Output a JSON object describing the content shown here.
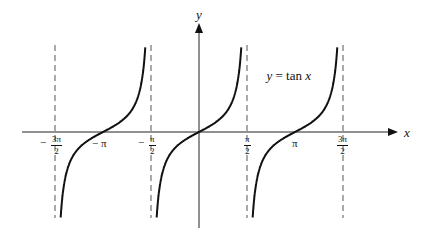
{
  "chart_data": {
    "type": "line",
    "title": "y = tan x",
    "xlabel": "x",
    "ylabel": "y",
    "function": "tan(x)",
    "xlim_radians": [
      -4.49,
      4.4
    ],
    "asymptotes": [
      "-3π/2",
      "-π/2",
      "π/2",
      "3π/2"
    ],
    "x_ticks": [
      {
        "value": -4.712,
        "label": "−3π/2"
      },
      {
        "value": -3.1416,
        "label": "−π"
      },
      {
        "value": -1.5708,
        "label": "−π/2"
      },
      {
        "value": 1.5708,
        "label": "π/2"
      },
      {
        "value": 3.1416,
        "label": "π"
      },
      {
        "value": 4.712,
        "label": "3π/2"
      }
    ],
    "branches": [
      {
        "center": "-π",
        "x_range": [
          "-3π/2",
          "-π/2"
        ],
        "zero_at": "-π"
      },
      {
        "center": "0",
        "x_range": [
          "-π/2",
          "π/2"
        ],
        "zero_at": "0"
      },
      {
        "center": "π",
        "x_range": [
          "π/2",
          "3π/2"
        ],
        "zero_at": "π"
      }
    ],
    "grid": false,
    "legend": "none",
    "annotation": "y = tan x"
  },
  "labels": {
    "x_axis": "x",
    "y_axis": "y",
    "equation_y": "y",
    "equation_rest": " = tan ",
    "equation_x": "x",
    "neg_pi": "− π",
    "pi": "π",
    "minus": "−",
    "pi_num": "π",
    "three_pi_num": "3π",
    "two": "2"
  },
  "colors": {
    "curve": "#111111",
    "axis": "#222222",
    "asymptote": "#555555"
  }
}
